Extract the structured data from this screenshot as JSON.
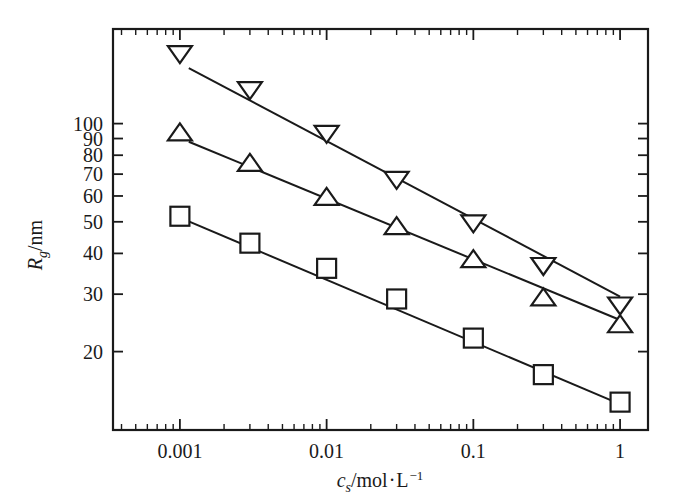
{
  "chart_data": {
    "type": "scatter",
    "title": "",
    "xlabel": "c_s/mol·L⁻¹",
    "ylabel": "R_g/nm",
    "xscale": "log",
    "yscale": "log",
    "xlim": [
      0.00035,
      1.55
    ],
    "ylim": [
      11.5,
      195
    ],
    "grid": false,
    "legend": "none",
    "x_tick_labels": [
      "0.001",
      "0.01",
      "0.1",
      "1"
    ],
    "x_tick_values": [
      0.001,
      0.01,
      0.1,
      1
    ],
    "y_tick_labels": [
      "100",
      "90",
      "80",
      "70",
      "60",
      "50",
      "40",
      "30",
      "20"
    ],
    "y_tick_values": [
      100,
      90,
      80,
      70,
      60,
      50,
      40,
      30,
      20
    ],
    "x": [
      0.001,
      0.003,
      0.01,
      0.03,
      0.1,
      0.3,
      1
    ],
    "series": [
      {
        "name": "down-triangle",
        "marker": "triangle-down",
        "values": [
          165,
          128,
          94,
          68,
          50,
          37,
          28
        ],
        "fit_line": {
          "x0": 0.00115,
          "y0": 148,
          "x1": 1.0,
          "y1": 29.5
        }
      },
      {
        "name": "up-triangle",
        "marker": "triangle-up",
        "values": [
          93,
          75,
          59,
          48,
          38,
          29,
          24
        ],
        "fit_line": {
          "x0": 0.00115,
          "y0": 88,
          "x1": 1.0,
          "y1": 25.0
        }
      },
      {
        "name": "square",
        "marker": "square",
        "values": [
          52,
          43,
          36,
          29,
          22,
          17,
          14
        ],
        "fit_line": {
          "x0": 0.001,
          "y0": 51.5,
          "x1": 1.0,
          "y1": 13.8
        }
      }
    ]
  },
  "axes": {
    "y_label_main": "R",
    "y_label_sub": "g",
    "y_label_tail": "/nm",
    "x_label_main": "c",
    "x_label_sub": "s",
    "x_label_mid": "/mol",
    "x_label_dot": "·",
    "x_label_unit": "L",
    "x_label_sup": "−1"
  },
  "colors": {
    "axis": "#1a1a1a",
    "marker_fill": "#ffffff",
    "marker_stroke": "#1a1a1a",
    "line": "#1a1a1a",
    "background": "#ffffff"
  }
}
